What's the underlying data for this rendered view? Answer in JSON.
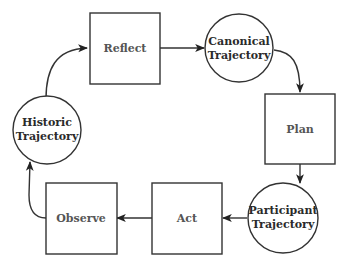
{
  "diagram": {
    "type": "cycle-flowchart",
    "nodes": [
      {
        "id": "reflect",
        "shape": "rect",
        "label": "Reflect"
      },
      {
        "id": "canonical",
        "shape": "circle",
        "label_line1": "Canonical",
        "label_line2": "Trajectory"
      },
      {
        "id": "plan",
        "shape": "rect",
        "label": "Plan"
      },
      {
        "id": "participant",
        "shape": "circle",
        "label_line1": "Participant",
        "label_line2": "Trajectory"
      },
      {
        "id": "act",
        "shape": "rect",
        "label": "Act"
      },
      {
        "id": "observe",
        "shape": "rect",
        "label": "Observe"
      },
      {
        "id": "historic",
        "shape": "circle",
        "label_line1": "Historic",
        "label_line2": "Trajectory"
      }
    ],
    "edges": [
      {
        "from": "historic",
        "to": "reflect"
      },
      {
        "from": "reflect",
        "to": "canonical"
      },
      {
        "from": "canonical",
        "to": "plan"
      },
      {
        "from": "plan",
        "to": "participant"
      },
      {
        "from": "participant",
        "to": "act"
      },
      {
        "from": "act",
        "to": "observe"
      },
      {
        "from": "observe",
        "to": "historic"
      }
    ],
    "colors": {
      "stroke": "#333333",
      "box_text": "#555555",
      "circle_text": "#2a2a2a",
      "background": "#ffffff"
    }
  }
}
